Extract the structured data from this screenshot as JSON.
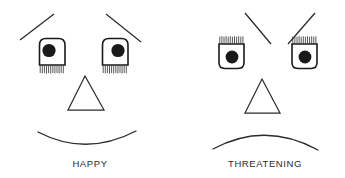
{
  "figure": {
    "background_color": "#ffffff",
    "ink_color": "#2b2b2b",
    "pupil_color": "#1a1a1a",
    "width": 345,
    "height": 178
  },
  "faces": [
    {
      "id": "happy-face",
      "label": "HAPPY",
      "label_x": 90,
      "label_y": 167,
      "eyebrows": {
        "name": "raised-outward-eyebrows",
        "left": {
          "x1": 20,
          "y1": 40,
          "x2": 54,
          "y2": 14
        },
        "right": {
          "x1": 106,
          "y1": 14,
          "x2": 141,
          "y2": 42
        }
      },
      "eyes": {
        "lash_position": "bottom",
        "corner_rounding": "top",
        "left": {
          "cx": 52,
          "cy": 52,
          "w": 26,
          "h": 26,
          "pupil_cx": 49,
          "pupil_cy": 50,
          "pupil_r": 6.6
        },
        "right": {
          "cx": 115,
          "cy": 52,
          "w": 26,
          "h": 26,
          "pupil_cx": 118,
          "pupil_cy": 50,
          "pupil_r": 6.6
        }
      },
      "nose": {
        "name": "triangle-nose",
        "apex_x": 85,
        "apex_y": 76,
        "left_x": 68,
        "right_x": 104,
        "base_y": 110
      },
      "mouth": {
        "name": "smile-mouth",
        "shape": "smile",
        "x1": 38,
        "y1": 132,
        "cx": 86,
        "cy": 157,
        "x2": 136,
        "y2": 131
      }
    },
    {
      "id": "threatening-face",
      "label": "THREATENING",
      "label_x": 265,
      "label_y": 167,
      "eyebrows": {
        "name": "lowered-inward-eyebrows",
        "left": {
          "x1": 245,
          "y1": 13,
          "x2": 271,
          "y2": 44
        },
        "right": {
          "x1": 288,
          "y1": 44,
          "x2": 315,
          "y2": 13
        }
      },
      "eyes": {
        "lash_position": "top",
        "corner_rounding": "bottom",
        "left": {
          "cx": 231,
          "cy": 55,
          "w": 25,
          "h": 25,
          "pupil_cx": 232,
          "pupil_cy": 57,
          "pupil_r": 6.4
        },
        "right": {
          "cx": 304,
          "cy": 55,
          "w": 25,
          "h": 25,
          "pupil_cx": 305,
          "pupil_cy": 57,
          "pupil_r": 6.4
        }
      },
      "nose": {
        "name": "triangle-nose",
        "apex_x": 262,
        "apex_y": 79,
        "left_x": 245,
        "right_x": 280,
        "base_y": 113
      },
      "mouth": {
        "name": "frown-mouth",
        "shape": "frown",
        "x1": 213,
        "y1": 149,
        "cx": 265,
        "cy": 121,
        "x2": 318,
        "y2": 150
      }
    }
  ]
}
